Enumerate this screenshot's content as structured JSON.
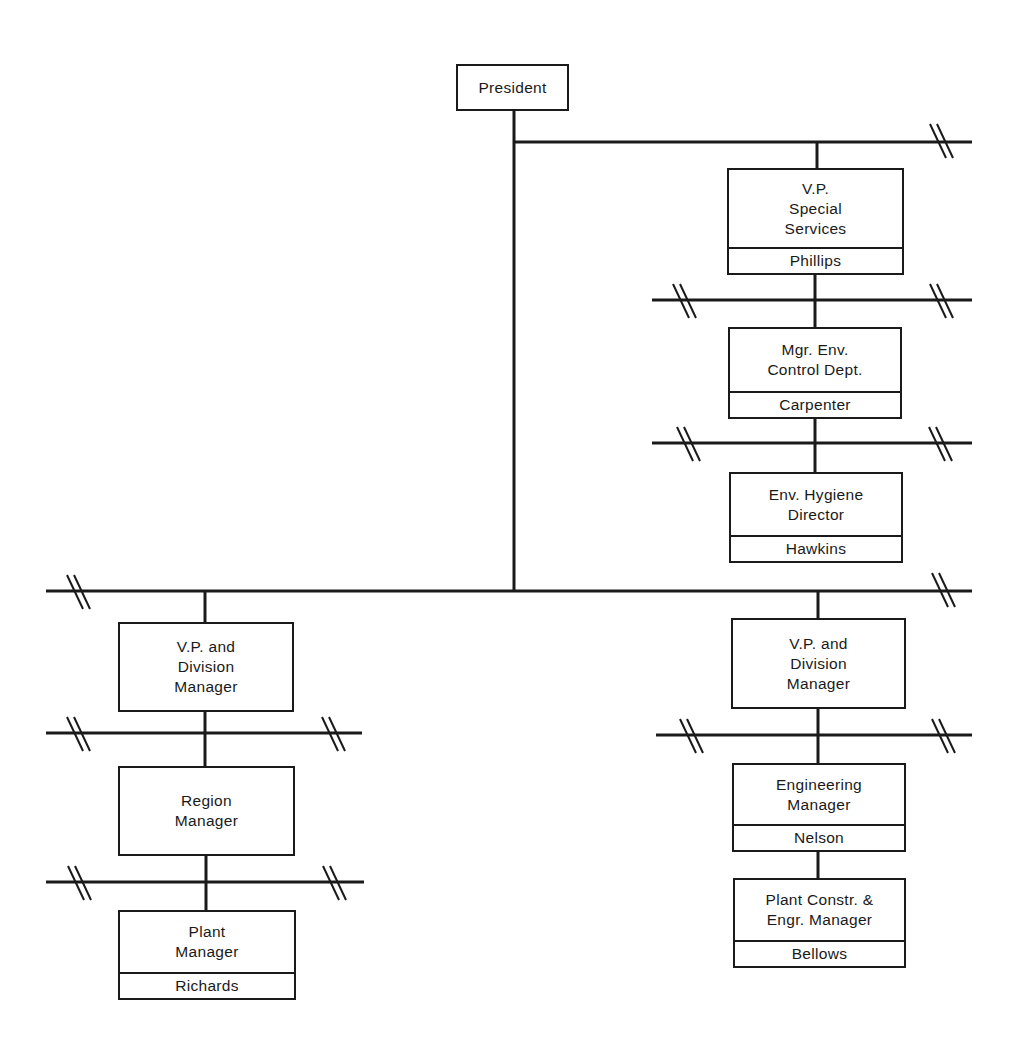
{
  "diagram": {
    "type": "organization-chart",
    "line_color": "#1a1a1a",
    "background": "#ffffff",
    "nodes": {
      "president": {
        "title": [
          "President"
        ],
        "name": null
      },
      "vp_special_services": {
        "title": [
          "V.P.",
          "Special",
          "Services"
        ],
        "name": "Phillips"
      },
      "mgr_env_control": {
        "title": [
          "Mgr. Env.",
          "Control Dept."
        ],
        "name": "Carpenter"
      },
      "env_hygiene_director": {
        "title": [
          "Env. Hygiene",
          "Director"
        ],
        "name": "Hawkins"
      },
      "vp_division_left": {
        "title": [
          "V.P. and",
          "Division",
          "Manager"
        ],
        "name": null
      },
      "region_manager": {
        "title": [
          "Region",
          "Manager"
        ],
        "name": null
      },
      "plant_manager": {
        "title": [
          "Plant",
          "Manager"
        ],
        "name": "Richards"
      },
      "vp_division_right": {
        "title": [
          "V.P. and",
          "Division",
          "Manager"
        ],
        "name": null
      },
      "engineering_manager": {
        "title": [
          "Engineering",
          "Manager"
        ],
        "name": "Nelson"
      },
      "plant_constr_engr_manager": {
        "title": [
          "Plant Constr. &",
          "Engr. Manager"
        ],
        "name": "Bellows"
      }
    },
    "edges": [
      [
        "president",
        "vp_special_services"
      ],
      [
        "vp_special_services",
        "mgr_env_control"
      ],
      [
        "mgr_env_control",
        "env_hygiene_director"
      ],
      [
        "president",
        "vp_division_left"
      ],
      [
        "president",
        "vp_division_right"
      ],
      [
        "vp_division_left",
        "region_manager"
      ],
      [
        "region_manager",
        "plant_manager"
      ],
      [
        "vp_division_right",
        "engineering_manager"
      ],
      [
        "engineering_manager",
        "plant_constr_engr_manager"
      ]
    ],
    "break_marks": "double slash (//) indicates omitted branches"
  }
}
